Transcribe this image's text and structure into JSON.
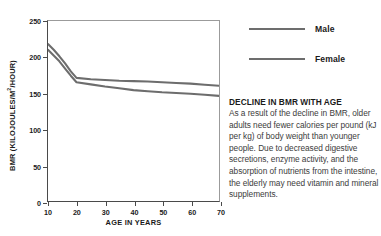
{
  "chart_data": {
    "type": "line",
    "title": "",
    "xlabel": "AGE IN YEARS",
    "ylabel": "BMR (KILOJOULES/M²/HOUR)",
    "ylabel_main": "BMR (KILOJOULES/M",
    "ylabel_sup": "2",
    "ylabel_tail": "/HOUR)",
    "xlim": [
      10,
      70
    ],
    "ylim": [
      0,
      250
    ],
    "xticks": [
      10,
      20,
      30,
      40,
      50,
      60,
      70
    ],
    "yticks": [
      0,
      50,
      100,
      150,
      200,
      250
    ],
    "xtick_labels": [
      "10",
      "20",
      "30",
      "40",
      "50",
      "60",
      "70"
    ],
    "ytick_labels": [
      "0",
      "50",
      "100",
      "150",
      "200",
      "250"
    ],
    "grid": false,
    "legend_position": "right",
    "line_color": "#6d6d6d",
    "series": [
      {
        "name": "Male",
        "color": "#6d6d6d",
        "x": [
          10,
          12,
          14,
          16,
          18,
          20,
          25,
          30,
          35,
          40,
          45,
          50,
          55,
          60,
          65,
          70
        ],
        "values": [
          218,
          210,
          201,
          191,
          180,
          171,
          169,
          168,
          167,
          166.5,
          166,
          165,
          164,
          163,
          161.5,
          160
        ]
      },
      {
        "name": "Female",
        "color": "#6d6d6d",
        "x": [
          10,
          12,
          14,
          16,
          18,
          20,
          25,
          30,
          35,
          40,
          45,
          50,
          55,
          60,
          65,
          70
        ],
        "values": [
          210,
          202,
          194,
          184,
          174,
          165,
          162,
          159,
          156.5,
          154,
          152.5,
          151,
          150,
          149,
          147.5,
          146
        ]
      }
    ]
  },
  "legend": {
    "items": [
      {
        "label": "Male"
      },
      {
        "label": "Female"
      }
    ]
  },
  "note": {
    "title": "DECLINE IN BMR WITH AGE",
    "body": "As a result of the decline in BMR, older adults need fewer calories per pound (kJ per kg) of body weight than younger people. Due to decreased digestive secretions, enzyme activity, and the absorption of nutrients from the intestine, the elderly may need vitamin and mineral supplements."
  }
}
